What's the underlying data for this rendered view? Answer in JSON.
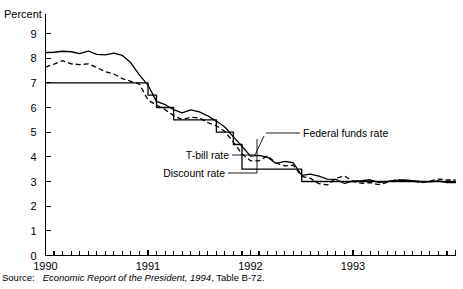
{
  "figure": {
    "ylabel": "Percent",
    "source_label": "Source:",
    "source_title": "Economic Report of the President, 1994",
    "source_tail": ", Table B-72."
  },
  "labels": {
    "federal_funds": "Federal funds rate",
    "tbill": "T-bill rate",
    "discount": "Discount rate"
  },
  "chart_data": {
    "type": "line",
    "title": "",
    "xlabel": "",
    "ylabel": "Percent",
    "xlim": [
      1990.0,
      1994.0
    ],
    "ylim": [
      0,
      9
    ],
    "yticks": [
      0,
      1,
      2,
      3,
      4,
      5,
      6,
      7,
      8,
      9
    ],
    "ytick_labels": [
      "0",
      "1",
      "2",
      "3",
      "4",
      "5",
      "6",
      "7",
      "8",
      "9"
    ],
    "xticks": [
      1990.0,
      1991.0,
      1992.0,
      1993.0
    ],
    "xtick_labels": [
      "1990",
      "1991",
      "1992",
      "1993"
    ],
    "minor_xticks_per_year": 12,
    "grid": false,
    "legend": "inline-annotations",
    "x": [
      1990.0,
      1990.083,
      1990.167,
      1990.25,
      1990.333,
      1990.417,
      1990.5,
      1990.583,
      1990.667,
      1990.75,
      1990.833,
      1990.917,
      1991.0,
      1991.083,
      1991.167,
      1991.25,
      1991.333,
      1991.417,
      1991.5,
      1991.583,
      1991.667,
      1991.75,
      1991.833,
      1991.917,
      1992.0,
      1992.083,
      1992.167,
      1992.25,
      1992.333,
      1992.417,
      1992.5,
      1992.583,
      1992.667,
      1992.75,
      1992.833,
      1992.917,
      1993.0,
      1993.083,
      1993.167,
      1993.25,
      1993.333,
      1993.417,
      1993.5,
      1993.583,
      1993.667,
      1993.75,
      1993.833,
      1993.917
    ],
    "series": [
      {
        "name": "Federal funds rate",
        "style": "solid",
        "values": [
          8.23,
          8.24,
          8.28,
          8.26,
          8.18,
          8.29,
          8.15,
          8.13,
          8.2,
          8.11,
          7.81,
          7.31,
          6.91,
          6.25,
          6.12,
          5.91,
          5.78,
          5.9,
          5.82,
          5.66,
          5.45,
          5.21,
          4.81,
          4.43,
          4.03,
          4.06,
          3.98,
          3.73,
          3.82,
          3.76,
          3.25,
          3.3,
          3.22,
          3.1,
          3.09,
          2.92,
          3.02,
          3.03,
          3.07,
          2.96,
          3.0,
          3.04,
          3.06,
          3.03,
          2.99,
          2.99,
          3.02,
          2.96
        ]
      },
      {
        "name": "T-bill rate",
        "style": "dashed",
        "values": [
          7.64,
          7.76,
          7.9,
          7.77,
          7.74,
          7.77,
          7.62,
          7.45,
          7.36,
          7.17,
          7.06,
          6.95,
          6.3,
          6.1,
          5.91,
          5.67,
          5.51,
          5.6,
          5.58,
          5.39,
          5.26,
          5.03,
          4.6,
          4.12,
          3.84,
          3.84,
          4.04,
          3.75,
          3.63,
          3.66,
          3.21,
          3.13,
          2.91,
          2.86,
          3.13,
          3.22,
          3.0,
          2.93,
          2.95,
          2.87,
          2.96,
          3.07,
          3.04,
          3.02,
          2.95,
          3.02,
          3.1,
          3.06
        ]
      },
      {
        "name": "Discount rate",
        "style": "solid-flat",
        "values": [
          7.0,
          7.0,
          7.0,
          7.0,
          7.0,
          7.0,
          7.0,
          7.0,
          7.0,
          7.0,
          7.0,
          7.0,
          6.5,
          6.0,
          6.0,
          5.5,
          5.5,
          5.5,
          5.5,
          5.5,
          5.0,
          5.0,
          4.5,
          3.5,
          3.5,
          3.5,
          3.5,
          3.5,
          3.5,
          3.5,
          3.0,
          3.0,
          3.0,
          3.0,
          3.0,
          3.0,
          3.0,
          3.0,
          3.0,
          3.0,
          3.0,
          3.0,
          3.0,
          3.0,
          3.0,
          3.0,
          3.0,
          3.0
        ]
      }
    ]
  }
}
